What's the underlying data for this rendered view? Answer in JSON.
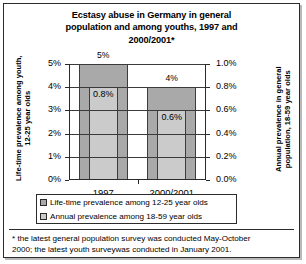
{
  "chart_data": {
    "type": "bar",
    "title": "Ecstasy abuse in Germany in general population and among youths,  1997 and 2000/2001*",
    "title_lines": [
      "Ecstasy abuse in Germany in general",
      "population and among youths,  1997 and",
      "2000/2001*"
    ],
    "categories": [
      "1997",
      "2000/2001"
    ],
    "series": [
      {
        "name": "Life-time prevalence among 12-25 year olds",
        "axis": "left",
        "values": [
          5,
          4
        ],
        "labels": [
          "5%",
          "4%"
        ],
        "color": "#a9a9a9"
      },
      {
        "name": "Annual prevalence  among 18-59 year olds",
        "axis": "right",
        "values": [
          0.8,
          0.6
        ],
        "labels": [
          "0.8%",
          "0.6%"
        ],
        "color": "#cbcbcb"
      }
    ],
    "left_axis": {
      "label": "Life-time prevalence among youth, 12-25 year olds",
      "label_lines": [
        "Life-time prevalence among youth,",
        "12-25 year olds"
      ],
      "ticks": [
        "0%",
        "1%",
        "2%",
        "3%",
        "4%",
        "5%"
      ],
      "values": [
        0,
        1,
        2,
        3,
        4,
        5
      ],
      "lim": [
        0,
        5
      ]
    },
    "right_axis": {
      "label": "Annual prevalence in general population, 18-59 year olds",
      "label_lines": [
        "Annual prevalence in general",
        "population, 18-59 year olds"
      ],
      "ticks": [
        "0.0%",
        "0.2%",
        "0.4%",
        "0.6%",
        "0.8%",
        "1.0%"
      ],
      "values": [
        0,
        0.2,
        0.4,
        0.6,
        0.8,
        1.0
      ],
      "lim": [
        0,
        1.0
      ]
    },
    "xlabel": "",
    "grid": true,
    "legend_position": "bottom"
  },
  "legend": {
    "items": [
      {
        "label": "Life-time prevalence among 12-25 year olds",
        "color": "#a9a9a9"
      },
      {
        "label": "Annual prevalence  among 18-59 year olds",
        "color": "#cbcbcb"
      }
    ]
  },
  "footnote": {
    "lines": [
      "* the latest general population survey was conducted May-October",
      "2000; the latest youth surveywas conducted in January 2001."
    ]
  }
}
